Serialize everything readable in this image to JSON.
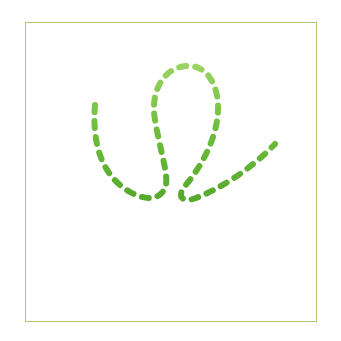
{
  "card": {
    "title": "Cursive Loop Tracing Practice Card",
    "background_color": "#ffffff",
    "frame": {
      "border_color": "#aecb6e",
      "border_width_px": 1.4,
      "x": 25,
      "y": 22,
      "width": 292,
      "height": 300
    }
  },
  "artwork": {
    "name": "dashed-cursive-loop-with-guide-lines",
    "description": "Dashed green cursive loop stroke above two dashed horizontal guide lines",
    "dash_color": "#6fbf3e",
    "dash_color_light": "#9ad364",
    "dash_color_dark": "#55a82b",
    "stroke_width_px": 6,
    "dash_pattern": "7 9",
    "paths": [
      {
        "name": "cursive-loop-stroke",
        "d": "M 95 105 C 92 140, 100 175, 130 192 C 152 204, 163 196, 166 185 C 168 172, 160 150, 155 120 C 150 92, 163 68, 186 66 C 207 64, 219 86, 218 110 C 217 140, 200 168, 185 186 C 176 197, 183 203, 196 198 C 222 188, 252 168, 275 144",
        "dash_array": "7 9",
        "stroke_width": 6
      },
      {
        "name": "guide-line-upper",
        "d": "M 68 230 L 276 230",
        "dash_array": "13 10",
        "stroke_width": 6,
        "dash_count": 9,
        "y": 230
      },
      {
        "name": "guide-line-lower",
        "d": "M 68 265 L 276 265",
        "dash_array": "13 10",
        "stroke_width": 6,
        "dash_count": 9,
        "y": 265
      }
    ]
  }
}
